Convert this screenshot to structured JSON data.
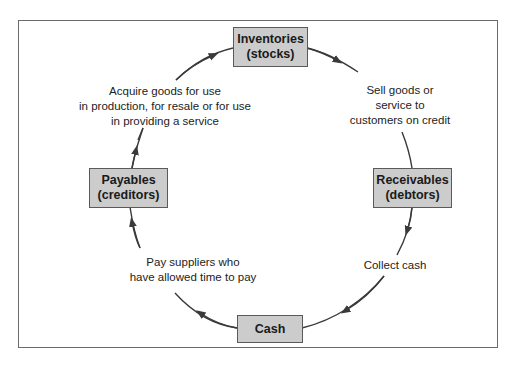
{
  "diagram": {
    "type": "cycle",
    "direction": "clockwise",
    "nodes": {
      "inventories": "Inventories\n(stocks)",
      "receivables": "Receivables\n(debtors)",
      "cash": "Cash",
      "payables": "Payables\n(creditors)"
    },
    "edges": [
      {
        "from": "inventories",
        "to": "receivables",
        "label": "Sell goods or\nservice to\ncustomers on credit"
      },
      {
        "from": "receivables",
        "to": "cash",
        "label": "Collect cash"
      },
      {
        "from": "cash",
        "to": "payables",
        "label": "Pay suppliers who\nhave allowed time to pay"
      },
      {
        "from": "payables",
        "to": "inventories",
        "label": "Acquire goods for use\nin production, for resale or for use\nin providing a service"
      }
    ],
    "colors": {
      "node_fill": "#cccccc",
      "node_border": "#5a5a5a",
      "arrow": "#3a3a3a",
      "frame": "#6b6b6b"
    }
  }
}
